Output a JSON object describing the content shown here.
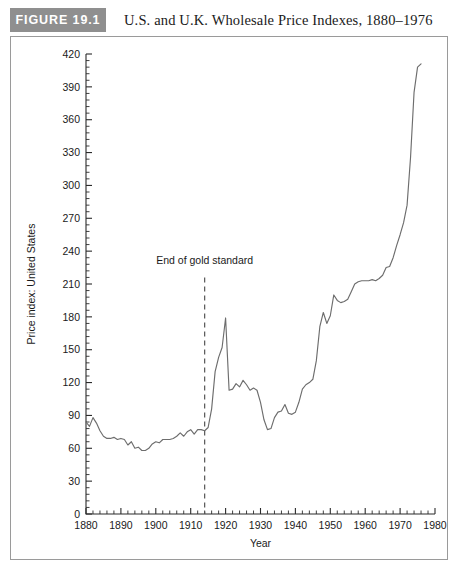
{
  "header": {
    "figure_tag": "FIGURE 19.1",
    "title": "U.S. and U.K. Wholesale Price Indexes, 1880–1976"
  },
  "colors": {
    "tag_background": "#8f8f8f",
    "tag_text": "#ffffff",
    "frame_border": "#9a9a9a",
    "series_line": "#6d6d6d",
    "event_line": "#555555",
    "axis": "#2b2b2b",
    "background": "#ffffff"
  },
  "chart_data": {
    "type": "line",
    "title": "U.S. and U.K. Wholesale Price Indexes, 1880–1976",
    "panel_label": "(a)",
    "xlabel": "Year",
    "ylabel": "Price index: United States",
    "xlim": [
      1880,
      1980
    ],
    "ylim": [
      0,
      420
    ],
    "x_major_ticks": [
      1880,
      1890,
      1900,
      1910,
      1920,
      1930,
      1940,
      1950,
      1960,
      1970,
      1980
    ],
    "x_tick_labels": [
      "1880",
      "1890",
      "1900",
      "1910",
      "1920",
      "1930",
      "1940",
      "1950",
      "1960",
      "1970",
      "1980"
    ],
    "x_minor_interval": 2,
    "y_major_ticks": [
      0,
      30,
      60,
      90,
      120,
      150,
      180,
      210,
      240,
      270,
      300,
      330,
      360,
      390,
      420
    ],
    "y_tick_labels": [
      "0",
      "30",
      "60",
      "90",
      "120",
      "150",
      "180",
      "210",
      "240",
      "270",
      "300",
      "330",
      "360",
      "390",
      "420"
    ],
    "y_minor_interval": 6,
    "grid": false,
    "legend": null,
    "annotations": [
      {
        "text": "End of gold standard",
        "x": 1914,
        "label_y": 228,
        "line_from_y": 216,
        "line_to_y": 0,
        "style": "dashed-vertical"
      }
    ],
    "series": [
      {
        "name": "Price index: United States",
        "x": [
          1880,
          1881,
          1882,
          1883,
          1884,
          1885,
          1886,
          1887,
          1888,
          1889,
          1890,
          1891,
          1892,
          1893,
          1894,
          1895,
          1896,
          1897,
          1898,
          1899,
          1900,
          1901,
          1902,
          1903,
          1904,
          1905,
          1906,
          1907,
          1908,
          1909,
          1910,
          1911,
          1912,
          1913,
          1914,
          1915,
          1916,
          1917,
          1918,
          1919,
          1920,
          1921,
          1922,
          1923,
          1924,
          1925,
          1926,
          1927,
          1928,
          1929,
          1930,
          1931,
          1932,
          1933,
          1934,
          1935,
          1936,
          1937,
          1938,
          1939,
          1940,
          1941,
          1942,
          1943,
          1944,
          1945,
          1946,
          1947,
          1948,
          1949,
          1950,
          1951,
          1952,
          1953,
          1954,
          1955,
          1956,
          1957,
          1958,
          1959,
          1960,
          1961,
          1962,
          1963,
          1964,
          1965,
          1966,
          1967,
          1968,
          1969,
          1970,
          1971,
          1972,
          1973,
          1974,
          1975,
          1976
        ],
        "values": [
          84,
          80,
          88,
          83,
          76,
          71,
          69,
          69,
          70,
          68,
          69,
          68,
          63,
          66,
          60,
          61,
          58,
          58,
          60,
          64,
          66,
          65,
          68,
          68,
          68,
          69,
          71,
          74,
          71,
          75,
          77,
          73,
          77,
          77,
          76,
          79,
          96,
          130,
          143,
          152,
          179,
          113,
          114,
          119,
          116,
          122,
          118,
          113,
          115,
          113,
          102,
          86,
          77,
          78,
          88,
          93,
          94,
          100,
          92,
          91,
          93,
          102,
          114,
          118,
          120,
          123,
          140,
          171,
          184,
          174,
          181,
          200,
          195,
          193,
          194,
          196,
          203,
          210,
          212,
          213,
          213,
          213,
          214,
          213,
          215,
          218,
          225,
          226,
          234,
          245,
          255,
          266,
          282,
          326,
          385,
          408,
          411
        ]
      }
    ]
  }
}
